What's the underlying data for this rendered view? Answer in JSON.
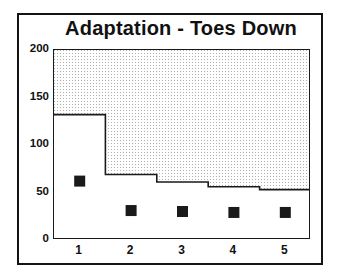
{
  "chart_data": {
    "type": "bar",
    "title": "Adaptation - Toes Down",
    "xlabel": "",
    "ylabel": "",
    "categories": [
      "1",
      "2",
      "3",
      "4",
      "5"
    ],
    "xtick_labels": [
      "1",
      "2",
      "3",
      "4",
      "5"
    ],
    "ytick_labels": [
      "0",
      "50",
      "100",
      "150",
      "200"
    ],
    "ytick_values": [
      0,
      50,
      100,
      150,
      200
    ],
    "ylim": [
      0,
      200
    ],
    "xlim": [
      0.5,
      5.5
    ],
    "grid": false,
    "legend": null,
    "series": [
      {
        "name": "bars",
        "type": "bar",
        "style": "step-outline",
        "fill": "none",
        "values": [
          132,
          69,
          61,
          56,
          53
        ]
      },
      {
        "name": "markers",
        "type": "scatter",
        "marker": "square",
        "color": "#1a1a1a",
        "values": [
          62,
          31,
          30,
          29,
          29
        ]
      }
    ],
    "shaded_region": {
      "description": "stippled background above bar outline",
      "pattern": "dots",
      "color": "#b9b9b9"
    },
    "colors": {
      "axis": "#1a1a1a",
      "text": "#111111",
      "marker": "#1a1a1a",
      "background": "#ffffff",
      "stipple": "#b9b9b9",
      "frame": "#141414"
    }
  }
}
